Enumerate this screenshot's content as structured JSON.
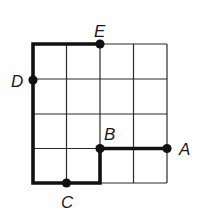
{
  "diagram": {
    "grid": {
      "cols": 4,
      "rows": 4,
      "x_lines": [
        33,
        66.5,
        100,
        133.5,
        167
      ],
      "y_lines": [
        44,
        79,
        114,
        148.5,
        183
      ],
      "line_color": "#2a2a2a"
    },
    "path": {
      "description": "Thick path from E left to top-left corner, down to bottom-left, right to C and on to x=100, up to B, right to A",
      "color": "#111111"
    },
    "points": [
      {
        "label": "A",
        "cx": 167,
        "cy": 148.5,
        "lx": 179,
        "ly": 155
      },
      {
        "label": "B",
        "cx": 100,
        "cy": 148.5,
        "lx": 104,
        "ly": 140
      },
      {
        "label": "C",
        "cx": 66.5,
        "cy": 183,
        "lx": 61,
        "ly": 208
      },
      {
        "label": "D",
        "cx": 33,
        "cy": 80,
        "lx": 11,
        "ly": 87
      },
      {
        "label": "E",
        "cx": 100,
        "cy": 44,
        "lx": 94,
        "ly": 37
      }
    ]
  }
}
